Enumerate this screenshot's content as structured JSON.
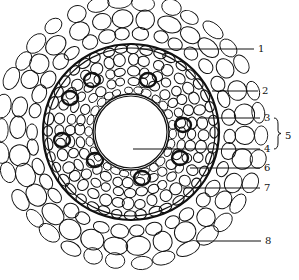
{
  "diagram": {
    "type": "root cross-section",
    "center": {
      "x": 131,
      "y": 132
    },
    "central_vessel": {
      "cx": 131,
      "cy": 132,
      "r": 36
    },
    "colors": {
      "line": "#111111",
      "background": "#ffffff"
    },
    "labels": [
      {
        "id": "1",
        "text": "1",
        "x": 258,
        "y": 49,
        "line_from_x": 140
      },
      {
        "id": "2",
        "text": "2",
        "x": 262,
        "y": 91,
        "line_from_x": 212
      },
      {
        "id": "3",
        "text": "3",
        "x": 264,
        "y": 118,
        "line_from_x": 200
      },
      {
        "id": "4",
        "text": "4",
        "x": 264,
        "y": 149,
        "line_from_x": 133
      },
      {
        "id": "6",
        "text": "6",
        "x": 264,
        "y": 168,
        "line_from_x": 190
      },
      {
        "id": "7",
        "text": "7",
        "x": 264,
        "y": 188,
        "line_from_x": 183
      },
      {
        "id": "8",
        "text": "8",
        "x": 265,
        "y": 241,
        "line_from_x": 197
      }
    ],
    "bracket_label": {
      "text": "5",
      "x": 285,
      "y": 136,
      "brace_x": 278,
      "brace_top": 118,
      "brace_bottom": 149
    }
  }
}
